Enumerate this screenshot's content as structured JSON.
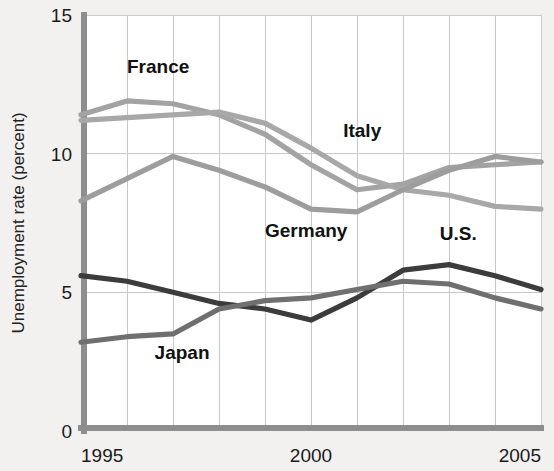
{
  "chart_data": {
    "type": "line",
    "title": "",
    "xlabel": "",
    "ylabel": "Unemployment rate (percent)",
    "xlim": [
      1995,
      2005
    ],
    "ylim": [
      0,
      15
    ],
    "yticks": [
      0,
      5,
      10,
      15
    ],
    "ytick_labels": [
      "0",
      "5",
      "10",
      "15"
    ],
    "xticks": [
      1995,
      2000,
      2005
    ],
    "xtick_labels": [
      "1995",
      "2000",
      "2005"
    ],
    "grid": true,
    "legend_position": "inline-labels",
    "x": [
      1995,
      1996,
      1997,
      1998,
      1999,
      2000,
      2001,
      2002,
      2003,
      2004,
      2005
    ],
    "series": [
      {
        "name": "France",
        "color": "#a3a3a3",
        "values": [
          11.4,
          11.9,
          11.8,
          11.4,
          10.7,
          9.6,
          8.7,
          8.9,
          9.5,
          9.6,
          9.7
        ],
        "label": "France",
        "label_x": 1996.0,
        "label_y": 12.9
      },
      {
        "name": "Italy",
        "color": "#a8a8a8",
        "values": [
          11.2,
          11.3,
          11.4,
          11.5,
          11.1,
          10.2,
          9.2,
          8.7,
          8.5,
          8.1,
          8.0
        ],
        "label": "Italy",
        "label_x": 2000.7,
        "label_y": 10.6
      },
      {
        "name": "Germany",
        "color": "#9d9d9d",
        "values": [
          8.3,
          9.1,
          9.9,
          9.4,
          8.8,
          8.0,
          7.9,
          8.7,
          9.4,
          9.9,
          9.7
        ],
        "label": "Germany",
        "label_x": 1999.0,
        "label_y": 7.0
      },
      {
        "name": "U.S.",
        "color": "#3c3c3c",
        "values": [
          5.6,
          5.4,
          5.0,
          4.6,
          4.4,
          4.0,
          4.8,
          5.8,
          6.0,
          5.6,
          5.1
        ],
        "label": "U.S.",
        "label_x": 2002.8,
        "label_y": 6.9
      },
      {
        "name": "Japan",
        "color": "#6f6f6f",
        "values": [
          3.2,
          3.4,
          3.5,
          4.4,
          4.7,
          4.8,
          5.1,
          5.4,
          5.3,
          4.8,
          4.4
        ],
        "label": "Japan",
        "label_x": 1996.6,
        "label_y": 2.6
      }
    ]
  }
}
